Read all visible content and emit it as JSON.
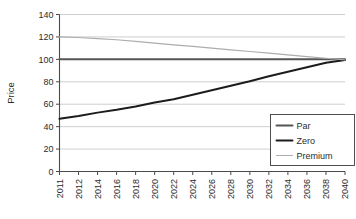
{
  "chart_data": {
    "type": "line",
    "title": "",
    "xlabel": "",
    "ylabel": "Price",
    "ylim": [
      0,
      140
    ],
    "ytick_labels": [
      "0",
      "20",
      "40",
      "60",
      "80",
      "100",
      "120",
      "140"
    ],
    "yticks": [
      0,
      20,
      40,
      60,
      80,
      100,
      120,
      140
    ],
    "grid": true,
    "legend_position": "lower-right",
    "x": [
      2011,
      2012,
      2014,
      2016,
      2018,
      2020,
      2022,
      2024,
      2026,
      2028,
      2030,
      2032,
      2034,
      2036,
      2038,
      2040
    ],
    "xtick_labels": [
      "2011",
      "2012",
      "2014",
      "2016",
      "2018",
      "2020",
      "2022",
      "2024",
      "2026",
      "2028",
      "2030",
      "2032",
      "2034",
      "2036",
      "2038",
      "2040"
    ],
    "series": [
      {
        "name": "Par",
        "color": "#555555",
        "width": 2.0,
        "values": [
          100,
          100,
          100,
          100,
          100,
          100,
          100,
          100,
          100,
          100,
          100,
          100,
          100,
          100,
          100,
          100
        ]
      },
      {
        "name": "Zero",
        "color": "#1c1c1c",
        "width": 2.0,
        "values": [
          47,
          49.5,
          52.5,
          55,
          58,
          61.5,
          64.5,
          68.5,
          72.5,
          76.5,
          80.5,
          85,
          89,
          93,
          97,
          99.5
        ]
      },
      {
        "name": "Premium",
        "color": "#adadad",
        "width": 1.2,
        "values": [
          120,
          119.5,
          118.5,
          117.5,
          116,
          114.5,
          113,
          111.5,
          110,
          108.5,
          107,
          105.5,
          104,
          102.5,
          101,
          99.5
        ]
      }
    ]
  },
  "legend": {
    "entries": [
      {
        "label": "Par"
      },
      {
        "label": "Zero"
      },
      {
        "label": "Premium"
      }
    ]
  }
}
